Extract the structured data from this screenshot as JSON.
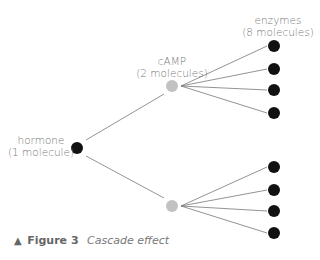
{
  "diagram": {
    "type": "cascade-tree",
    "colors": {
      "dark_node": "#111111",
      "light_node": "#c2c2c2",
      "line": "#777777",
      "label": "#7a7a7a"
    },
    "levels": [
      {
        "name": "hormone",
        "title": "hormone",
        "count": "(1 molecule)",
        "node_color": "dark"
      },
      {
        "name": "cAMP",
        "title": "cAMP",
        "count": "(2 molecules)",
        "node_color": "light"
      },
      {
        "name": "enzymes",
        "title": "enzymes",
        "count": "(8 molecules)",
        "node_color": "dark"
      }
    ],
    "nodes": {
      "hormone": {
        "x": 77,
        "y": 148
      },
      "camp": [
        {
          "x": 172,
          "y": 86
        },
        {
          "x": 172,
          "y": 206
        }
      ],
      "enzymes": [
        {
          "x": 274,
          "y": 46
        },
        {
          "x": 274,
          "y": 69
        },
        {
          "x": 274,
          "y": 90
        },
        {
          "x": 274,
          "y": 113
        },
        {
          "x": 274,
          "y": 167
        },
        {
          "x": 274,
          "y": 190
        },
        {
          "x": 274,
          "y": 211
        },
        {
          "x": 274,
          "y": 233
        }
      ]
    }
  },
  "caption": {
    "marker": "▲",
    "figure_label": "Figure 3",
    "title": "Cascade effect"
  }
}
